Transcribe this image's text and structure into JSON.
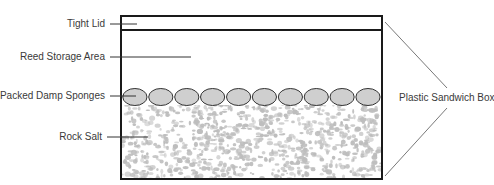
{
  "diagram": {
    "title": "",
    "labels": {
      "lid": "Tight Lid",
      "storage": "Reed Storage Area",
      "sponges": "Packed Damp Sponges",
      "salt": "Rock Salt",
      "box": "Plastic Sandwich Box"
    },
    "sponge_count": 10,
    "colors": {
      "outline": "#1a1a1a",
      "sponge_fill": "#cfcfcf",
      "salt_speckle": "#bdbdbd",
      "leader": "#333333",
      "text": "#3a3a3a"
    }
  }
}
